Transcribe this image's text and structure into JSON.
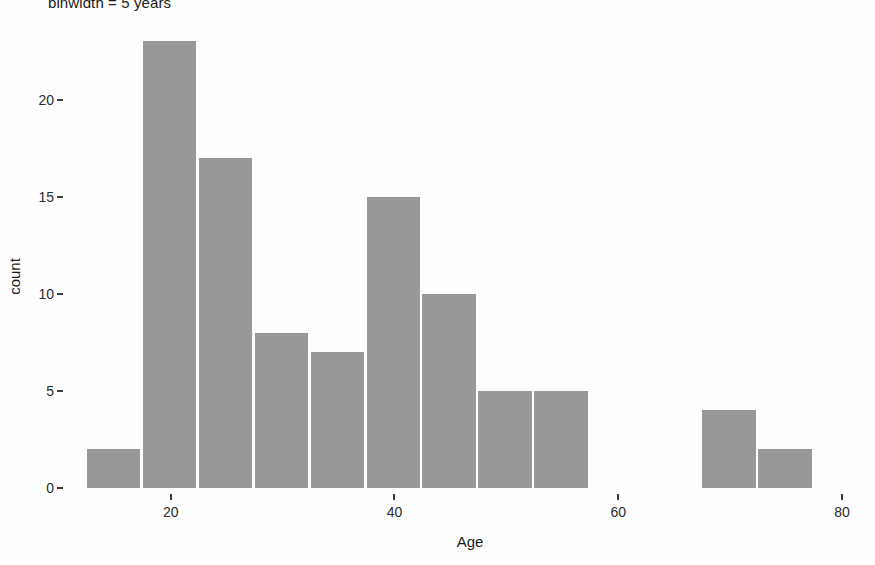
{
  "chart_data": {
    "type": "bar",
    "title": "binwidth = 5 years",
    "xlabel": "Age",
    "ylabel": "count",
    "categories": [
      15,
      20,
      25,
      30,
      35,
      40,
      45,
      50,
      55,
      60,
      65,
      70,
      75
    ],
    "values": [
      2,
      23,
      17,
      8,
      7,
      15,
      10,
      5,
      5,
      0,
      0,
      4,
      2
    ],
    "bins": [
      {
        "center": 15,
        "low": 12.5,
        "high": 17.5,
        "count": 2
      },
      {
        "center": 20,
        "low": 17.5,
        "high": 22.5,
        "count": 23
      },
      {
        "center": 25,
        "low": 22.5,
        "high": 27.5,
        "count": 17
      },
      {
        "center": 30,
        "low": 27.5,
        "high": 32.5,
        "count": 8
      },
      {
        "center": 35,
        "low": 32.5,
        "high": 37.5,
        "count": 7
      },
      {
        "center": 40,
        "low": 37.5,
        "high": 42.5,
        "count": 15
      },
      {
        "center": 45,
        "low": 42.5,
        "high": 47.5,
        "count": 10
      },
      {
        "center": 50,
        "low": 47.5,
        "high": 52.5,
        "count": 5
      },
      {
        "center": 55,
        "low": 52.5,
        "high": 57.5,
        "count": 5
      },
      {
        "center": 60,
        "low": 57.5,
        "high": 62.5,
        "count": 0
      },
      {
        "center": 65,
        "low": 62.5,
        "high": 67.5,
        "count": 0
      },
      {
        "center": 70,
        "low": 67.5,
        "high": 72.5,
        "count": 4
      },
      {
        "center": 75,
        "low": 72.5,
        "high": 77.5,
        "count": 2
      }
    ],
    "binwidth": 5,
    "xlim": [
      11.0,
      82.5
    ],
    "ylim": [
      0,
      24
    ],
    "xticks": [
      "20",
      "40",
      "60",
      "80"
    ],
    "xtick_values": [
      20,
      40,
      60,
      80
    ],
    "yticks": [
      "0",
      "5",
      "10",
      "15",
      "20"
    ],
    "ytick_values": [
      0,
      5,
      10,
      15,
      20
    ],
    "grid": false,
    "legend": false,
    "bar_color": "#989898",
    "background_color": "#fdfdfd",
    "text_color": "#1a1a1a"
  }
}
